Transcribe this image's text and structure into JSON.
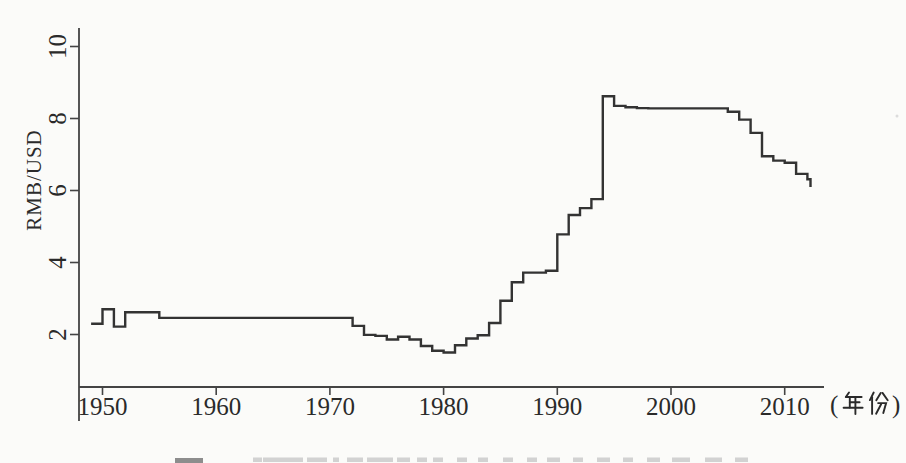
{
  "page": {
    "background_color": "#fbfbf9",
    "caption_cut_off": true
  },
  "chart_data": {
    "type": "line",
    "step": true,
    "title": "",
    "ylabel": "RMB/USD",
    "x_unit_label": "(年份)",
    "x_ticks": [
      1950,
      1960,
      1970,
      1980,
      1990,
      2000,
      2010
    ],
    "y_ticks": [
      2,
      4,
      6,
      8,
      10
    ],
    "xlim": [
      1948.5,
      2013
    ],
    "ylim": [
      0.5,
      10.6
    ],
    "grid": false,
    "legend": "none",
    "line_color": "#333333",
    "axis_color": "#444444",
    "tick_label_color": "#2a2a2a",
    "series": [
      {
        "name": "RMB per USD exchange rate",
        "years": [
          1949,
          1950,
          1951,
          1952,
          1953,
          1954,
          1955,
          1956,
          1957,
          1958,
          1959,
          1960,
          1961,
          1962,
          1963,
          1964,
          1965,
          1966,
          1967,
          1968,
          1969,
          1970,
          1971,
          1972,
          1973,
          1974,
          1975,
          1976,
          1977,
          1978,
          1979,
          1980,
          1981,
          1982,
          1983,
          1984,
          1985,
          1986,
          1987,
          1988,
          1989,
          1990,
          1991,
          1992,
          1993,
          1994,
          1995,
          1996,
          1997,
          1998,
          1999,
          2000,
          2001,
          2002,
          2003,
          2004,
          2005,
          2006,
          2007,
          2008,
          2009,
          2010,
          2011,
          2012
        ],
        "values": [
          2.3,
          2.7,
          2.22,
          2.62,
          2.62,
          2.62,
          2.46,
          2.46,
          2.46,
          2.46,
          2.46,
          2.46,
          2.46,
          2.46,
          2.46,
          2.46,
          2.46,
          2.46,
          2.46,
          2.46,
          2.46,
          2.46,
          2.46,
          2.24,
          1.99,
          1.96,
          1.86,
          1.94,
          1.86,
          1.68,
          1.55,
          1.5,
          1.7,
          1.89,
          1.98,
          2.32,
          2.94,
          3.45,
          3.72,
          3.72,
          3.77,
          4.78,
          5.32,
          5.51,
          5.76,
          8.62,
          8.35,
          8.31,
          8.29,
          8.28,
          8.28,
          8.28,
          8.28,
          8.28,
          8.28,
          8.28,
          8.19,
          7.97,
          7.6,
          6.95,
          6.83,
          6.77,
          6.46,
          6.31
        ],
        "end_value": 6.1
      }
    ]
  }
}
